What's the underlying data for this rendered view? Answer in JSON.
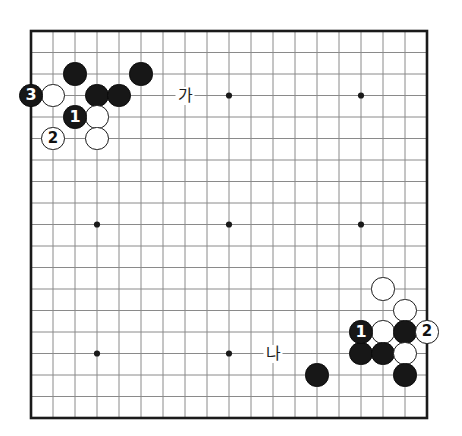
{
  "diagram": {
    "kind": "go-board-diagram",
    "board_size": 19,
    "background_color": "#ffffff",
    "line_color": "#8a8a8a",
    "border_color": "#1a1a1a",
    "black_color": "#171717",
    "white_color": "#ffffff",
    "geometry": {
      "left": 31,
      "top": 31,
      "step_x": 22.0,
      "step_y": 21.5,
      "stone_radius": 11.6,
      "border_width": 2.6,
      "grid_width": 1.0
    },
    "star_points": [
      {
        "col": 3,
        "row": 3
      },
      {
        "col": 9,
        "row": 3
      },
      {
        "col": 15,
        "row": 3
      },
      {
        "col": 3,
        "row": 9
      },
      {
        "col": 9,
        "row": 9
      },
      {
        "col": 15,
        "row": 9
      },
      {
        "col": 3,
        "row": 15
      },
      {
        "col": 9,
        "row": 15
      },
      {
        "col": 15,
        "row": 15
      }
    ],
    "stones": [
      {
        "id": "b-c2-r2",
        "color": "black",
        "col": 2,
        "row": 2,
        "number": ""
      },
      {
        "id": "b-c5-r2",
        "color": "black",
        "col": 5,
        "row": 2,
        "number": ""
      },
      {
        "id": "b-c0-r3",
        "color": "black",
        "col": 0,
        "row": 3,
        "number": "3"
      },
      {
        "id": "w-c1-r3",
        "color": "white",
        "col": 1,
        "row": 3,
        "number": ""
      },
      {
        "id": "b-c3-r3",
        "color": "black",
        "col": 3,
        "row": 3,
        "number": ""
      },
      {
        "id": "b-c4-r3",
        "color": "black",
        "col": 4,
        "row": 3,
        "number": ""
      },
      {
        "id": "b-c2-r4",
        "color": "black",
        "col": 2,
        "row": 4,
        "number": "1"
      },
      {
        "id": "w-c3-r4",
        "color": "white",
        "col": 3,
        "row": 4,
        "number": ""
      },
      {
        "id": "w-c1-r5",
        "color": "white",
        "col": 1,
        "row": 5,
        "number": "2"
      },
      {
        "id": "w-c3-r5",
        "color": "white",
        "col": 3,
        "row": 5,
        "number": ""
      },
      {
        "id": "w-c16-r12",
        "color": "white",
        "col": 16,
        "row": 12,
        "number": ""
      },
      {
        "id": "w-c17-r13",
        "color": "white",
        "col": 17,
        "row": 13,
        "number": ""
      },
      {
        "id": "b-c15-r14",
        "color": "black",
        "col": 15,
        "row": 14,
        "number": "1"
      },
      {
        "id": "w-c16-r14",
        "color": "white",
        "col": 16,
        "row": 14,
        "number": ""
      },
      {
        "id": "b-c17-r14",
        "color": "black",
        "col": 17,
        "row": 14,
        "number": ""
      },
      {
        "id": "w-c18-r14",
        "color": "white",
        "col": 18,
        "row": 14,
        "number": "2"
      },
      {
        "id": "b-c15-r15",
        "color": "black",
        "col": 15,
        "row": 15,
        "number": ""
      },
      {
        "id": "b-c16-r15",
        "color": "black",
        "col": 16,
        "row": 15,
        "number": ""
      },
      {
        "id": "w-c17-r15",
        "color": "white",
        "col": 17,
        "row": 15,
        "number": ""
      },
      {
        "id": "b-c13-r16",
        "color": "black",
        "col": 13,
        "row": 16,
        "number": ""
      },
      {
        "id": "b-c17-r16",
        "color": "black",
        "col": 17,
        "row": 16,
        "number": ""
      }
    ],
    "point_labels": [
      {
        "id": "label-ga",
        "text": "가",
        "col": 7,
        "row": 3
      },
      {
        "id": "label-na",
        "text": "나",
        "col": 11,
        "row": 15
      }
    ]
  }
}
